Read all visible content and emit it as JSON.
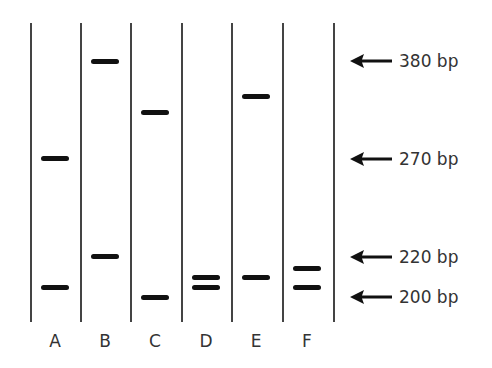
{
  "diagram": {
    "type": "gel_electrophoresis",
    "band_color": "#111111",
    "line_color": "#444444",
    "lanes": [
      {
        "label": "A",
        "center_x": 55,
        "bands": [
          {
            "y": 158
          },
          {
            "y": 287
          }
        ]
      },
      {
        "label": "B",
        "center_x": 105,
        "bands": [
          {
            "y": 61
          },
          {
            "y": 256
          }
        ]
      },
      {
        "label": "C",
        "center_x": 155,
        "bands": [
          {
            "y": 112
          },
          {
            "y": 297
          }
        ]
      },
      {
        "label": "D",
        "center_x": 206,
        "bands": [
          {
            "y": 277
          },
          {
            "y": 287
          }
        ]
      },
      {
        "label": "E",
        "center_x": 256,
        "bands": [
          {
            "y": 96
          },
          {
            "y": 277
          }
        ]
      },
      {
        "label": "F",
        "center_x": 307,
        "bands": [
          {
            "y": 268
          },
          {
            "y": 287
          }
        ]
      }
    ],
    "lane_dividers_x": [
      30,
      80,
      130,
      181,
      231,
      282,
      333
    ],
    "markers": [
      {
        "label": "380 bp",
        "y": 61
      },
      {
        "label": "270 bp",
        "y": 159
      },
      {
        "label": "220 bp",
        "y": 257
      },
      {
        "label": "200 bp",
        "y": 297
      }
    ]
  }
}
